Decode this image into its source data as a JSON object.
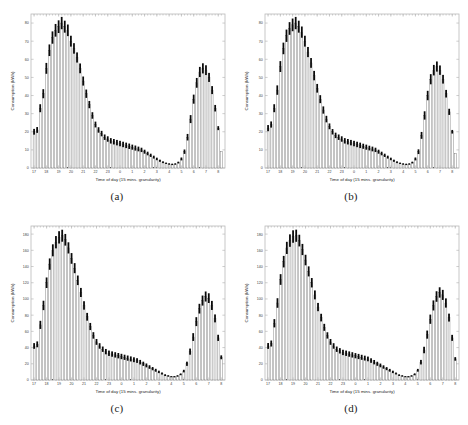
{
  "figure": {
    "background": "#ffffff",
    "panel_border_color": "#b9b9b9",
    "bar_fill": "#ffffff",
    "bar_edge": "#575757",
    "errorbar_color": "#0a0a0a",
    "panels": [
      {
        "key": "a",
        "caption": "(a)"
      },
      {
        "key": "b",
        "caption": "(b)"
      },
      {
        "key": "c",
        "caption": "(c)"
      },
      {
        "key": "d",
        "caption": "(d)"
      }
    ]
  },
  "chart_data": [
    {
      "type": "bar",
      "panel": "(a)",
      "title": "",
      "xlabel": "Time of day (15 mins. granularity)",
      "ylabel": "Consumption (kWh)",
      "xtick_labels": [
        "17",
        "18",
        "19",
        "20",
        "21",
        "22",
        "23",
        "0",
        "1",
        "2",
        "3",
        "4",
        "5",
        "6",
        "7",
        "8"
      ],
      "ytick_labels": [
        "0",
        "10",
        "20",
        "30",
        "40",
        "50",
        "60",
        "70",
        "80"
      ],
      "ylim": [
        0,
        85
      ],
      "grid": false,
      "legend": null,
      "x": [
        "17:00",
        "17:15",
        "17:30",
        "17:45",
        "18:00",
        "18:15",
        "18:30",
        "18:45",
        "19:00",
        "19:15",
        "19:30",
        "19:45",
        "20:00",
        "20:15",
        "20:30",
        "20:45",
        "21:00",
        "21:15",
        "21:30",
        "21:45",
        "22:00",
        "22:15",
        "22:30",
        "22:45",
        "23:00",
        "23:15",
        "23:30",
        "23:45",
        "0:00",
        "0:15",
        "0:30",
        "0:45",
        "1:00",
        "1:15",
        "1:30",
        "1:45",
        "2:00",
        "2:15",
        "2:30",
        "2:45",
        "3:00",
        "3:15",
        "3:30",
        "3:45",
        "4:00",
        "4:15",
        "4:30",
        "4:45",
        "5:00",
        "5:15",
        "5:30",
        "5:45",
        "6:00",
        "6:15",
        "6:30",
        "6:45",
        "7:00",
        "7:15",
        "7:30",
        "7:45",
        "8:00"
      ],
      "values": [
        20,
        21,
        33,
        41,
        55,
        65,
        72,
        76,
        78,
        80,
        78,
        76,
        70,
        66,
        61,
        55,
        48,
        41,
        35,
        29,
        24,
        21,
        19,
        17,
        16,
        15,
        14.5,
        14,
        13.5,
        13,
        12.5,
        12,
        11.5,
        11,
        10.5,
        10,
        9,
        8,
        7,
        6,
        5,
        4,
        3.2,
        2.6,
        2.2,
        2,
        2.2,
        3,
        5,
        9,
        17,
        27,
        38,
        47,
        53,
        55,
        54,
        50,
        43,
        33,
        22,
        9
      ],
      "errors": [
        1.6,
        1.6,
        2.2,
        2.5,
        3.0,
        3.2,
        3.4,
        3.5,
        3.5,
        3.4,
        3.3,
        3.2,
        3.0,
        2.9,
        2.8,
        2.7,
        2.5,
        2.3,
        2.0,
        1.8,
        1.6,
        1.5,
        1.5,
        1.5,
        1.5,
        1.5,
        1.5,
        1.5,
        1.5,
        1.5,
        1.5,
        1.5,
        1.4,
        1.4,
        1.3,
        1.2,
        1.1,
        1.0,
        0.9,
        0.8,
        0.7,
        0.6,
        0.5,
        0.4,
        0.4,
        0.4,
        0.4,
        0.5,
        0.8,
        1.2,
        1.8,
        2.2,
        2.5,
        2.7,
        2.8,
        2.8,
        2.7,
        2.5,
        2.2,
        1.8,
        1.1
      ]
    },
    {
      "type": "bar",
      "panel": "(b)",
      "title": "",
      "xlabel": "Time of day (15 mins. granularity)",
      "ylabel": "Consumption (kWh)",
      "xtick_labels": [
        "17",
        "18",
        "19",
        "20",
        "21",
        "22",
        "23",
        "0",
        "1",
        "2",
        "3",
        "4",
        "5",
        "6",
        "7",
        "8"
      ],
      "ytick_labels": [
        "0",
        "10",
        "20",
        "30",
        "40",
        "50",
        "60",
        "70",
        "80"
      ],
      "ylim": [
        0,
        85
      ],
      "grid": false,
      "legend": null,
      "x": [
        "17:00",
        "17:15",
        "17:30",
        "17:45",
        "18:00",
        "18:15",
        "18:30",
        "18:45",
        "19:00",
        "19:15",
        "19:30",
        "19:45",
        "20:00",
        "20:15",
        "20:30",
        "20:45",
        "21:00",
        "21:15",
        "21:30",
        "21:45",
        "22:00",
        "22:15",
        "22:30",
        "22:45",
        "23:00",
        "23:15",
        "23:30",
        "23:45",
        "0:00",
        "0:15",
        "0:30",
        "0:45",
        "1:00",
        "1:15",
        "1:30",
        "1:45",
        "2:00",
        "2:15",
        "2:30",
        "2:45",
        "3:00",
        "3:15",
        "3:30",
        "3:45",
        "4:00",
        "4:15",
        "4:30",
        "4:45",
        "5:00",
        "5:15",
        "5:30",
        "5:45",
        "6:00",
        "6:15",
        "6:30",
        "6:45",
        "7:00",
        "7:15",
        "7:30",
        "7:45",
        "8:00"
      ],
      "values": [
        22,
        24,
        33,
        43,
        56,
        66,
        73,
        77,
        79,
        80,
        78,
        75,
        70,
        64,
        58,
        51,
        44,
        38,
        32,
        27,
        23,
        20,
        18,
        17,
        16,
        15,
        14.5,
        14,
        13.5,
        13,
        12.5,
        12,
        11.5,
        11,
        10.5,
        10,
        9,
        8,
        7,
        6,
        5,
        4,
        3.2,
        2.6,
        2.2,
        2,
        2.2,
        3,
        5,
        9,
        18,
        29,
        40,
        49,
        54,
        56,
        54,
        49,
        41,
        31,
        20,
        8
      ],
      "errors": [
        1.7,
        1.7,
        2.2,
        2.6,
        3.0,
        3.2,
        3.4,
        3.5,
        3.5,
        3.4,
        3.3,
        3.1,
        3.0,
        2.8,
        2.7,
        2.6,
        2.4,
        2.2,
        2.0,
        1.8,
        1.6,
        1.5,
        1.5,
        1.5,
        1.5,
        1.5,
        1.5,
        1.5,
        1.5,
        1.5,
        1.5,
        1.4,
        1.4,
        1.3,
        1.3,
        1.2,
        1.1,
        1.0,
        0.9,
        0.8,
        0.7,
        0.6,
        0.5,
        0.4,
        0.4,
        0.4,
        0.4,
        0.5,
        0.8,
        1.3,
        1.9,
        2.3,
        2.6,
        2.8,
        2.9,
        2.8,
        2.6,
        2.4,
        2.1,
        1.7,
        1.0
      ]
    },
    {
      "type": "bar",
      "panel": "(c)",
      "title": "",
      "xlabel": "Time of day (15 mins. granularity)",
      "ylabel": "Consumption (kWh)",
      "xtick_labels": [
        "17",
        "18",
        "19",
        "20",
        "21",
        "22",
        "23",
        "0",
        "1",
        "2",
        "3",
        "4",
        "5",
        "6",
        "7",
        "8"
      ],
      "ytick_labels": [
        "0",
        "20",
        "40",
        "60",
        "80",
        "100",
        "120",
        "140",
        "160",
        "180"
      ],
      "ylim": [
        0,
        190
      ],
      "grid": false,
      "legend": null,
      "x": [
        "17:00",
        "17:15",
        "17:30",
        "17:45",
        "18:00",
        "18:15",
        "18:30",
        "18:45",
        "19:00",
        "19:15",
        "19:30",
        "19:45",
        "20:00",
        "20:15",
        "20:30",
        "20:45",
        "21:00",
        "21:15",
        "21:30",
        "21:45",
        "22:00",
        "22:15",
        "22:30",
        "22:45",
        "23:00",
        "23:15",
        "23:30",
        "23:45",
        "0:00",
        "0:15",
        "0:30",
        "0:45",
        "1:00",
        "1:15",
        "1:30",
        "1:45",
        "2:00",
        "2:15",
        "2:30",
        "2:45",
        "3:00",
        "3:15",
        "3:30",
        "3:45",
        "4:00",
        "4:15",
        "4:30",
        "4:45",
        "5:00",
        "5:15",
        "5:30",
        "5:45",
        "6:00",
        "6:15",
        "6:30",
        "6:45",
        "7:00",
        "7:15",
        "7:30",
        "7:45",
        "8:00"
      ],
      "values": [
        42,
        44,
        68,
        92,
        120,
        143,
        160,
        170,
        176,
        178,
        173,
        163,
        150,
        138,
        123,
        108,
        92,
        78,
        66,
        55,
        47,
        42,
        38,
        35,
        33,
        32,
        31,
        30,
        29,
        28,
        27,
        26,
        25,
        24,
        22,
        20,
        18,
        16,
        14,
        12,
        10,
        8,
        6,
        5,
        4,
        4,
        5,
        7,
        11,
        20,
        35,
        53,
        72,
        88,
        98,
        103,
        101,
        92,
        76,
        52,
        28
      ],
      "errors": [
        3.5,
        3.6,
        5.0,
        5.8,
        6.5,
        7.0,
        7.4,
        7.6,
        7.6,
        7.4,
        7.2,
        6.9,
        6.6,
        6.2,
        5.9,
        5.6,
        5.2,
        4.8,
        4.4,
        4.0,
        3.6,
        3.4,
        3.3,
        3.3,
        3.3,
        3.3,
        3.3,
        3.3,
        3.3,
        3.2,
        3.2,
        3.1,
        3.0,
        2.9,
        2.8,
        2.6,
        2.4,
        2.2,
        2.0,
        1.8,
        1.5,
        1.3,
        1.1,
        0.9,
        0.8,
        0.8,
        0.9,
        1.1,
        1.6,
        2.6,
        3.8,
        4.8,
        5.5,
        6.0,
        6.2,
        6.2,
        6.0,
        5.6,
        4.9,
        3.8,
        2.4
      ]
    },
    {
      "type": "bar",
      "panel": "(d)",
      "title": "",
      "xlabel": "Time of day (15 mins. granularity)",
      "ylabel": "Consumption (kWh)",
      "xtick_labels": [
        "17",
        "18",
        "19",
        "20",
        "21",
        "22",
        "23",
        "0",
        "1",
        "2",
        "3",
        "4",
        "5",
        "6",
        "7",
        "8"
      ],
      "ytick_labels": [
        "0",
        "20",
        "40",
        "60",
        "80",
        "100",
        "120",
        "140",
        "160",
        "180"
      ],
      "ylim": [
        0,
        190
      ],
      "grid": false,
      "legend": null,
      "x": [
        "17:00",
        "17:15",
        "17:30",
        "17:45",
        "18:00",
        "18:15",
        "18:30",
        "18:45",
        "19:00",
        "19:15",
        "19:30",
        "19:45",
        "20:00",
        "20:15",
        "20:30",
        "20:45",
        "21:00",
        "21:15",
        "21:30",
        "21:45",
        "22:00",
        "22:15",
        "22:30",
        "22:45",
        "23:00",
        "23:15",
        "23:30",
        "23:45",
        "0:00",
        "0:15",
        "0:30",
        "0:45",
        "1:00",
        "1:15",
        "1:30",
        "1:45",
        "2:00",
        "2:15",
        "2:30",
        "2:45",
        "3:00",
        "3:15",
        "3:30",
        "3:45",
        "4:00",
        "4:15",
        "4:30",
        "4:45",
        "5:00",
        "5:15",
        "5:30",
        "5:45",
        "6:00",
        "6:15",
        "6:30",
        "6:45",
        "7:00",
        "7:15",
        "7:30",
        "7:45",
        "8:00"
      ],
      "values": [
        42,
        45,
        70,
        95,
        124,
        146,
        163,
        172,
        177,
        178,
        172,
        161,
        148,
        134,
        120,
        105,
        90,
        77,
        65,
        55,
        47,
        42,
        38,
        36,
        34,
        33,
        32,
        31,
        30,
        29,
        28,
        27,
        26,
        24,
        22,
        20,
        18,
        16,
        14,
        12,
        10,
        8,
        6,
        5,
        4,
        4,
        5,
        7,
        12,
        22,
        37,
        56,
        75,
        92,
        103,
        108,
        105,
        95,
        77,
        52,
        26
      ],
      "errors": [
        3.6,
        3.7,
        5.1,
        5.9,
        6.6,
        7.1,
        7.5,
        7.7,
        7.7,
        7.5,
        7.2,
        6.9,
        6.5,
        6.2,
        5.8,
        5.5,
        5.1,
        4.7,
        4.3,
        3.9,
        3.6,
        3.4,
        3.3,
        3.3,
        3.3,
        3.3,
        3.3,
        3.3,
        3.2,
        3.2,
        3.1,
        3.0,
        2.9,
        2.8,
        2.7,
        2.5,
        2.3,
        2.1,
        1.9,
        1.7,
        1.5,
        1.2,
        1.0,
        0.9,
        0.8,
        0.8,
        0.9,
        1.2,
        1.7,
        2.8,
        4.0,
        5.0,
        5.7,
        6.2,
        6.5,
        6.4,
        6.2,
        5.7,
        4.9,
        3.7,
        2.2
      ]
    }
  ]
}
